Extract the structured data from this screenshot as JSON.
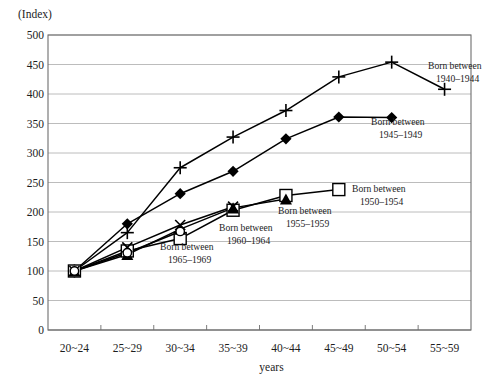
{
  "chart_data": {
    "type": "line",
    "title": "",
    "subtitle": "",
    "unit_label": "(Index)",
    "xlabel": "years",
    "ylabel": "",
    "categories": [
      "20~24",
      "25~29",
      "30~34",
      "35~39",
      "40~44",
      "45~49",
      "50~54",
      "55~59"
    ],
    "ylim": [
      0,
      500
    ],
    "ytick_step": 50,
    "yticks": [
      "500",
      "450",
      "400",
      "350",
      "300",
      "250",
      "200",
      "150",
      "100",
      "50",
      "0"
    ],
    "grid": true,
    "legend_position": "inline-annotations",
    "series": [
      {
        "name": "Born between 1940–1944",
        "label_line1": "Born between",
        "label_line2": "1940–1944",
        "marker": "plus",
        "color": "#000000",
        "x": [
          "20~24",
          "25~29",
          "30~34",
          "35~39",
          "40~44",
          "45~49",
          "50~54",
          "55~59"
        ],
        "values": [
          100,
          165,
          275,
          327,
          372,
          429,
          454,
          408
        ]
      },
      {
        "name": "Born between 1945–1949",
        "label_line1": "Born between",
        "label_line2": "1945–1949",
        "marker": "diamond",
        "color": "#000000",
        "x": [
          "20~24",
          "25~29",
          "30~34",
          "35~39",
          "40~44",
          "45~49",
          "50~54"
        ],
        "values": [
          100,
          180,
          231,
          269,
          324,
          361,
          360
        ]
      },
      {
        "name": "Born between 1950–1954",
        "label_line1": "Born between",
        "label_line2": "1950–1954",
        "marker": "square",
        "color": "#000000",
        "x": [
          "20~24",
          "25~29",
          "30~34",
          "35~39",
          "40~44",
          "45~49"
        ],
        "values": [
          100,
          134,
          155,
          203,
          228,
          238
        ]
      },
      {
        "name": "Born between 1955–1959",
        "label_line1": "Born between",
        "label_line2": "1955–1959",
        "marker": "triangle",
        "color": "#000000",
        "x": [
          "20~24",
          "25~29",
          "30~34",
          "35~39",
          "40~44"
        ],
        "values": [
          100,
          128,
          171,
          207,
          222
        ]
      },
      {
        "name": "Born between 1960–1964",
        "label_line1": "Born between",
        "label_line2": "1960–1964",
        "marker": "cross",
        "color": "#000000",
        "x": [
          "20~24",
          "25~29",
          "30~34",
          "35~39"
        ],
        "values": [
          100,
          140,
          178,
          209
        ]
      },
      {
        "name": "Born between 1965–1969",
        "label_line1": "Born between",
        "label_line2": "1965–1969",
        "marker": "circle",
        "color": "#000000",
        "x": [
          "20~24",
          "25~29",
          "30~34"
        ],
        "values": [
          100,
          131,
          167
        ]
      }
    ],
    "annotations": [
      {
        "text_line1": "Born between",
        "text_line2": "1940–1944",
        "x_px": 428,
        "y_px": 60
      },
      {
        "text_line1": "Born between",
        "text_line2": "1945–1949",
        "x_px": 371,
        "y_px": 116
      },
      {
        "text_line1": "Born between",
        "text_line2": "1950–1954",
        "x_px": 352,
        "y_px": 183
      },
      {
        "text_line1": "Born between",
        "text_line2": "1955–1959",
        "x_px": 278,
        "y_px": 205
      },
      {
        "text_line1": "Born between",
        "text_line2": "1960–1964",
        "x_px": 219,
        "y_px": 222
      },
      {
        "text_line1": "Born between",
        "text_line2": "1965–1969",
        "x_px": 160,
        "y_px": 241
      }
    ]
  },
  "plot_geometry": {
    "left": 48,
    "right": 471,
    "top": 35,
    "bottom": 330
  }
}
